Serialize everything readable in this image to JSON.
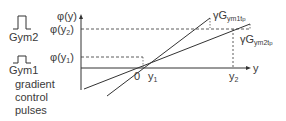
{
  "legend": {
    "pulse_top_label": "Gym2",
    "pulse_bottom_label": "Gym1",
    "caption_lines": [
      "gradient",
      "control",
      "pulses"
    ]
  },
  "axes": {
    "y_axis_label": "φ(y)",
    "x_axis_label": "y",
    "origin_label": "0",
    "y_ticks": [
      {
        "base": "φ(y",
        "sub": "2",
        "close": ")"
      },
      {
        "base": "φ(y",
        "sub": "1",
        "close": ")"
      }
    ],
    "x_ticks": [
      {
        "base": "y",
        "sub": "1"
      },
      {
        "base": "y",
        "sub": "2"
      }
    ]
  },
  "lines": [
    {
      "label_prefix": "γG",
      "label_sub": "ym1",
      "label_t": "t",
      "label_tsub": "p"
    },
    {
      "label_prefix": "γG",
      "label_sub": "ym2",
      "label_t": "t",
      "label_tsub": "p"
    }
  ],
  "colors": {
    "line": "#333333",
    "text": "#3a3a3a"
  }
}
